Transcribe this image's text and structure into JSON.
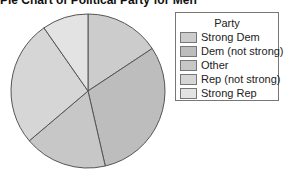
{
  "chart_data": {
    "type": "pie",
    "title": "Pie Chart of Political Party for Men",
    "legend_title": "Party",
    "legend_position": "right",
    "categories": [
      "Strong Dem",
      "Dem (not strong)",
      "Other",
      "Rep (not strong)",
      "Strong Rep"
    ],
    "values": [
      15.7,
      30.7,
      17.4,
      26.5,
      9.7
    ],
    "unit": "percent (estimated)",
    "start_angle": "12 o'clock, clockwise",
    "colors": [
      "#cccccc",
      "#bdbdbd",
      "#c7c7c7",
      "#d6d6d6",
      "#e3e3e3"
    ]
  },
  "legend": {
    "title": "Party",
    "items": [
      {
        "label": "Strong Dem",
        "color": "#cccccc"
      },
      {
        "label": "Dem (not strong)",
        "color": "#bdbdbd"
      },
      {
        "label": "Other",
        "color": "#c7c7c7"
      },
      {
        "label": "Rep (not strong)",
        "color": "#d6d6d6"
      },
      {
        "label": "Strong Rep",
        "color": "#e3e3e3"
      }
    ]
  }
}
